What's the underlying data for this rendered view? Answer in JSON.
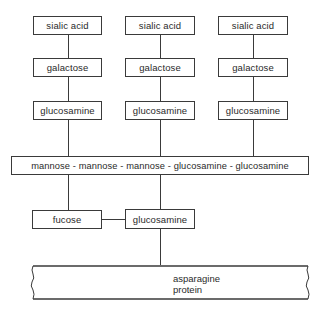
{
  "diagram": {
    "type": "glycoprotein oligosaccharide structure",
    "branches": [
      {
        "sialic": "sialic acid",
        "galactose": "galactose",
        "glucosamine": "glucosamine"
      },
      {
        "sialic": "sialic acid",
        "galactose": "galactose",
        "glucosamine": "glucosamine"
      },
      {
        "sialic": "sialic acid",
        "galactose": "galactose",
        "glucosamine": "glucosamine"
      }
    ],
    "core": "mannose - mannose - mannose - glucosamine - glucosamine",
    "fucose": "fucose",
    "linker": "glucosamine",
    "anchor": {
      "line1": "asparagine",
      "line2": "protein"
    }
  }
}
